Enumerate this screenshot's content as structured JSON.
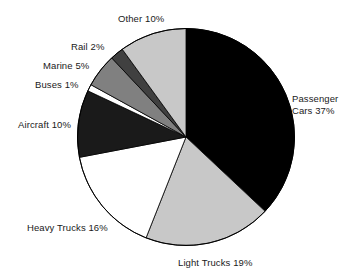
{
  "chart_data": {
    "type": "pie",
    "title": "",
    "xlabel": "",
    "ylabel": "",
    "legend_position": "none",
    "grid": false,
    "unit": "%",
    "start_angle_deg": 0,
    "direction": "clockwise",
    "categories": [
      "Passenger Cars",
      "Light Trucks",
      "Heavy Trucks",
      "Aircraft",
      "Buses",
      "Marine",
      "Rail",
      "Other"
    ],
    "values": [
      37,
      19,
      16,
      10,
      1,
      5,
      2,
      10
    ],
    "labels": [
      "Passenger Cars 37%",
      "Light Trucks 19%",
      "Heavy Trucks 16%",
      "Aircraft 10%",
      "Buses 1%",
      "Marine 5%",
      "Rail 2%",
      "Other 10%"
    ],
    "slice_colors": [
      "#000000",
      "#c8c8c8",
      "#ffffff",
      "#1a1a1a",
      "#ffffff",
      "#808080",
      "#404040",
      "#c8c8c8"
    ],
    "outline_color": "#000000"
  },
  "labels": {
    "passenger_cars": "Passenger Cars 37%",
    "light_trucks": "Light Trucks 19%",
    "heavy_trucks": "Heavy Trucks 16%",
    "aircraft": "Aircraft 10%",
    "buses": "Buses 1%",
    "marine": "Marine 5%",
    "rail": "Rail 2%",
    "other": "Other 10%"
  }
}
